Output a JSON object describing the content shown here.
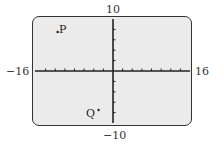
{
  "chart_data": {
    "type": "scatter",
    "title": "",
    "xlabel": "",
    "ylabel": "",
    "xlim": [
      -16,
      16
    ],
    "ylim": [
      -10,
      10
    ],
    "x_tick_spacing": 2,
    "y_tick_spacing": 2,
    "grid": false,
    "window_labels": {
      "xmin": "−16",
      "xmax": "16",
      "ymin": "−10",
      "ymax": "10"
    },
    "points": [
      {
        "label": "P",
        "x": -11.5,
        "y": 7.5
      },
      {
        "label": "Q",
        "x": -3,
        "y": -7.5
      }
    ]
  },
  "labels": {
    "xmin": "−16",
    "xmax": "16",
    "ymin": "−10",
    "ymax": "10",
    "p": "P",
    "q": "Q"
  },
  "colors": {
    "screen_bg": "#ebebeb",
    "axis": "#222222",
    "frame": "#333333"
  }
}
